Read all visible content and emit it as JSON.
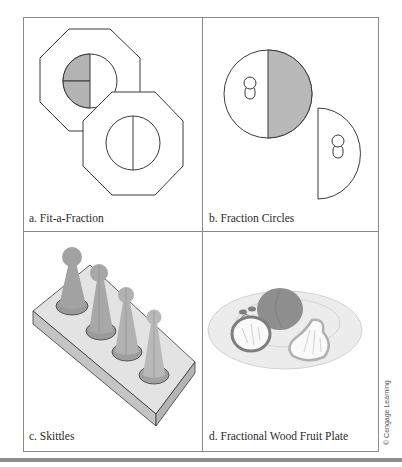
{
  "figure": {
    "panels": [
      {
        "id": "a",
        "caption": "a. Fit-a-Fraction",
        "depicts": "two octagonal frames with circle inserts; one circle divided into quarters with two quarters shaded, one divided into halves"
      },
      {
        "id": "b",
        "caption": "b. Fraction Circles",
        "depicts": "circle divided into halves with one half shaded, plus a separate half-circle piece with knob handles"
      },
      {
        "id": "c",
        "caption": "c. Skittles",
        "depicts": "four cone-shaped pegs in a block base"
      },
      {
        "id": "d",
        "caption": "d. Fractional Wood Fruit Plate",
        "depicts": "oval plate with apple, round fruit and pear"
      }
    ],
    "credit": "© Cengage Learning",
    "colors": {
      "line": "#3a3a3a",
      "shade": "#b3b3b3",
      "frame": "#8a8a8a",
      "skittle": "#a9a9a9",
      "block_top": "#e3e3e3",
      "block_side": "#c4c4c4",
      "plate": "#e6e6e6",
      "fruit_dark": "#8e8e8e"
    }
  }
}
